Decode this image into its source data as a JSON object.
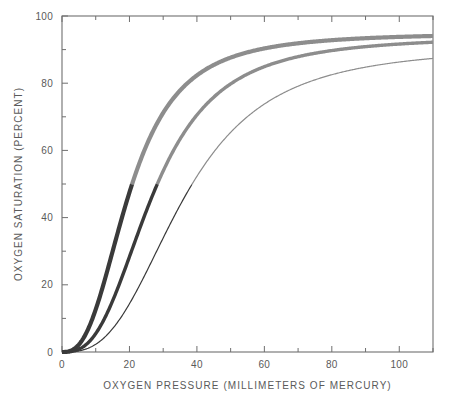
{
  "chart_data": {
    "type": "line",
    "title": "",
    "xlabel": "OXYGEN PRESSURE (MILLIMETERS OF MERCURY)",
    "ylabel": "OXYGEN SATURATION (PERCENT)",
    "xlim": [
      0,
      110
    ],
    "ylim": [
      0,
      100
    ],
    "xticks": [
      0,
      20,
      40,
      60,
      80,
      100
    ],
    "xtick_labels": [
      "0",
      "20",
      "40",
      "60",
      "80",
      "100"
    ],
    "xminor_step": 10,
    "yticks": [
      0,
      20,
      40,
      60,
      80,
      100
    ],
    "ytick_labels": [
      "0",
      "20",
      "40",
      "60",
      "80",
      "100"
    ],
    "yminor_step": 10,
    "grid": false,
    "legend": "none",
    "frame": "full-box",
    "x": [
      0,
      5,
      10,
      15,
      20,
      25,
      30,
      35,
      40,
      45,
      50,
      55,
      60,
      65,
      70,
      75,
      80,
      85,
      90,
      95,
      100,
      105,
      110
    ],
    "series": [
      {
        "name": "left-shifted curve",
        "p50": 20,
        "hill_n": 2.7,
        "smax": 95,
        "line_width": 4.2,
        "color_below_50": "#3a3a3a",
        "color_above_50": "#8d8d8d",
        "values": [
          0,
          9.4,
          27.0,
          43.6,
          56.1,
          65.1,
          71.6,
          76.3,
          79.8,
          82.5,
          84.6,
          86.3,
          87.6,
          88.7,
          89.6,
          90.3,
          91.0,
          91.5,
          92.0,
          92.4,
          92.8,
          93.1,
          93.4
        ]
      },
      {
        "name": "middle curve",
        "p50": 27,
        "hill_n": 2.8,
        "smax": 94,
        "line_width": 3.4,
        "color_below_50": "#3a3a3a",
        "color_above_50": "#8d8d8d",
        "values": [
          0,
          4.5,
          15.2,
          28.6,
          41.2,
          51.8,
          60.3,
          67.0,
          72.2,
          76.3,
          79.5,
          82.1,
          84.2,
          85.9,
          87.3,
          88.5,
          89.5,
          90.3,
          91.0,
          91.6,
          92.1,
          92.6,
          93.0
        ]
      },
      {
        "name": "right-shifted curve",
        "p50": 36,
        "hill_n": 2.85,
        "smax": 91,
        "line_width": 1.2,
        "color_below_50": "#3a3a3a",
        "color_above_50": "#555555",
        "values": [
          0,
          2.1,
          7.5,
          15.2,
          23.9,
          32.5,
          40.6,
          47.8,
          54.1,
          59.5,
          64.1,
          68.0,
          71.3,
          74.1,
          76.5,
          78.5,
          80.3,
          81.9,
          83.2,
          84.4,
          85.5,
          86.4,
          87.2
        ]
      }
    ]
  },
  "colors": {
    "axis": "#6f6f6f",
    "text": "#5a5a5a",
    "curve_dark": "#3a3a3a",
    "curve_light": "#8d8d8d",
    "background": "#ffffff"
  }
}
